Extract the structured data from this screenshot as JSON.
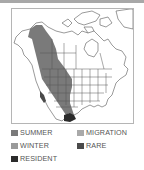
{
  "map": {
    "title": "Range map",
    "region": "North America",
    "colors": {
      "summer": "#7a7a7a",
      "migration": "#a9a9a9",
      "winter": "#9a9a9a",
      "rare": "#4a4a4a",
      "resident": "#2b2b2b",
      "land": "#ffffff",
      "border": "#555555"
    }
  },
  "legend": {
    "items": [
      {
        "key": "summer",
        "label": "SUMMER",
        "color": "#7a7a7a"
      },
      {
        "key": "migration",
        "label": "MIGRATION",
        "color": "#a9a9a9"
      },
      {
        "key": "winter",
        "label": "WINTER",
        "color": "#9a9a9a"
      },
      {
        "key": "rare",
        "label": "RARE",
        "color": "#4a4a4a"
      },
      {
        "key": "resident",
        "label": "RESIDENT",
        "color": "#2b2b2b"
      }
    ]
  }
}
